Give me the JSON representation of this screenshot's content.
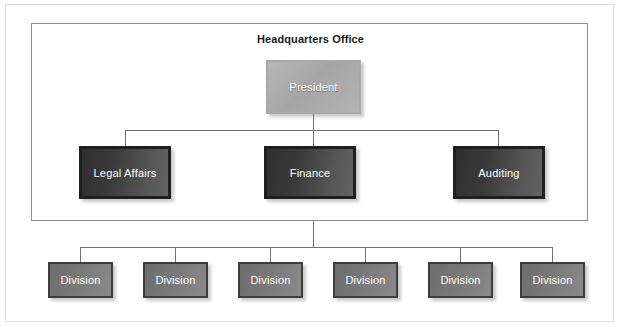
{
  "diagram": {
    "type": "organization-chart",
    "title": "Headquarters Office",
    "colors": {
      "frame_border": "#dcdcdc",
      "container_border": "#8e8e8e",
      "connector": "#6f6f6f",
      "president_fill": "#b0b0b0",
      "department_fill": "#3a3a3a",
      "division_fill": "#7a7a7a",
      "node_text": "#ffffff",
      "title_text": "#1b1b1b"
    },
    "nodes": {
      "root": {
        "label": "President"
      },
      "departments": [
        {
          "label": "Legal Affairs"
        },
        {
          "label": "Finance"
        },
        {
          "label": "Auditing"
        }
      ],
      "divisions": [
        {
          "label": "Division"
        },
        {
          "label": "Division"
        },
        {
          "label": "Division"
        },
        {
          "label": "Division"
        },
        {
          "label": "Division"
        },
        {
          "label": "Division"
        }
      ]
    }
  }
}
